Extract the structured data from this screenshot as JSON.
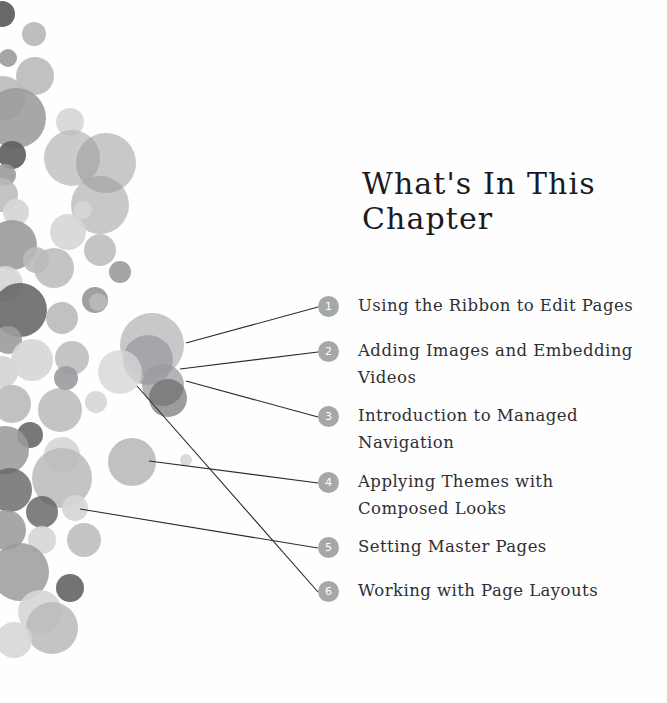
{
  "page": {
    "background_color": "#fefefe",
    "title": "What's In This Chapter",
    "title_color": "#1b1b1f",
    "text_color": "#2f2f33",
    "bullet_color": "#a6a7a9",
    "bullet_text_color": "#ffffff",
    "line_color": "#2b2b2b"
  },
  "toc": {
    "items": [
      {
        "number": "1",
        "label": "Using the Ribbon to Edit Pages"
      },
      {
        "number": "2",
        "label": "Adding Images and Embedding Videos"
      },
      {
        "number": "3",
        "label": "Introduction to Managed Navigation"
      },
      {
        "number": "4",
        "label": "Applying Themes with Composed Looks"
      },
      {
        "number": "5",
        "label": "Setting Master Pages"
      },
      {
        "number": "6",
        "label": "Working with Page Layouts"
      }
    ]
  },
  "decor": {
    "palette": {
      "dark": "#5f6062",
      "mid": "#9a9b9d",
      "light": "#b9babb",
      "pale": "#d5d6d7"
    },
    "circles": [
      {
        "cx": 2,
        "cy": 14,
        "r": 13,
        "c": "#5f6062",
        "o": 0.95
      },
      {
        "cx": 34,
        "cy": 34,
        "r": 12,
        "c": "#b9babb",
        "o": 0.95
      },
      {
        "cx": 8,
        "cy": 58,
        "r": 9,
        "c": "#9a9b9d",
        "o": 0.9
      },
      {
        "cx": 35,
        "cy": 76,
        "r": 19,
        "c": "#b9babb",
        "o": 0.9
      },
      {
        "cx": 3,
        "cy": 98,
        "r": 22,
        "c": "#b9babb",
        "o": 0.9
      },
      {
        "cx": 16,
        "cy": 118,
        "r": 30,
        "c": "#9a9b9d",
        "o": 0.88
      },
      {
        "cx": 12,
        "cy": 155,
        "r": 14,
        "c": "#5f6062",
        "o": 0.92
      },
      {
        "cx": 5,
        "cy": 175,
        "r": 11,
        "c": "#9a9b9d",
        "o": 0.9
      },
      {
        "cx": 1,
        "cy": 195,
        "r": 17,
        "c": "#b9babb",
        "o": 0.85
      },
      {
        "cx": 16,
        "cy": 212,
        "r": 13,
        "c": "#d5d6d7",
        "o": 0.95
      },
      {
        "cx": 70,
        "cy": 122,
        "r": 14,
        "c": "#d5d6d7",
        "o": 0.9
      },
      {
        "cx": 72,
        "cy": 158,
        "r": 28,
        "c": "#b9babb",
        "o": 0.75
      },
      {
        "cx": 12,
        "cy": 245,
        "r": 25,
        "c": "#9a9b9d",
        "o": 0.9
      },
      {
        "cx": 5,
        "cy": 284,
        "r": 18,
        "c": "#d5d6d7",
        "o": 0.9
      },
      {
        "cx": 36,
        "cy": 260,
        "r": 13,
        "c": "#b9babb",
        "o": 0.9
      },
      {
        "cx": 100,
        "cy": 205,
        "r": 29,
        "c": "#b9babb",
        "o": 0.8
      },
      {
        "cx": 106,
        "cy": 163,
        "r": 30,
        "c": "#9a9b9d",
        "o": 0.55
      },
      {
        "cx": 20,
        "cy": 310,
        "r": 27,
        "c": "#5f6062",
        "o": 0.85
      },
      {
        "cx": 62,
        "cy": 318,
        "r": 16,
        "c": "#b9babb",
        "o": 0.9
      },
      {
        "cx": 8,
        "cy": 340,
        "r": 14,
        "c": "#9a9b9d",
        "o": 0.9
      },
      {
        "cx": 54,
        "cy": 268,
        "r": 20,
        "c": "#b9babb",
        "o": 0.85
      },
      {
        "cx": 95,
        "cy": 300,
        "r": 13,
        "c": "#9a9b9d",
        "o": 0.95
      },
      {
        "cx": 2,
        "cy": 372,
        "r": 16,
        "c": "#d5d6d7",
        "o": 0.95
      },
      {
        "cx": 32,
        "cy": 360,
        "r": 21,
        "c": "#d5d6d7",
        "o": 0.9
      },
      {
        "cx": 72,
        "cy": 358,
        "r": 17,
        "c": "#b9babb",
        "o": 0.85
      },
      {
        "cx": 12,
        "cy": 404,
        "r": 19,
        "c": "#b9babb",
        "o": 0.9
      },
      {
        "cx": 60,
        "cy": 410,
        "r": 22,
        "c": "#b9babb",
        "o": 0.85
      },
      {
        "cx": 30,
        "cy": 435,
        "r": 13,
        "c": "#5f6062",
        "o": 0.85
      },
      {
        "cx": 5,
        "cy": 450,
        "r": 24,
        "c": "#9a9b9d",
        "o": 0.88
      },
      {
        "cx": 62,
        "cy": 455,
        "r": 18,
        "c": "#d5d6d7",
        "o": 0.9
      },
      {
        "cx": 66,
        "cy": 378,
        "r": 12,
        "c": "#9a9b9d",
        "o": 0.9
      },
      {
        "cx": 96,
        "cy": 402,
        "r": 11,
        "c": "#d5d6d7",
        "o": 0.9
      },
      {
        "cx": 120,
        "cy": 272,
        "r": 11,
        "c": "#9a9b9d",
        "o": 0.9
      },
      {
        "cx": 100,
        "cy": 250,
        "r": 16,
        "c": "#b9babb",
        "o": 0.85
      },
      {
        "cx": 68,
        "cy": 232,
        "r": 18,
        "c": "#d5d6d7",
        "o": 0.9
      },
      {
        "cx": 152,
        "cy": 345,
        "r": 32,
        "c": "#b9babb",
        "o": 0.8
      },
      {
        "cx": 148,
        "cy": 360,
        "r": 25,
        "c": "#9a9b9d",
        "o": 0.75
      },
      {
        "cx": 120,
        "cy": 372,
        "r": 22,
        "c": "#d5d6d7",
        "o": 0.8
      },
      {
        "cx": 163,
        "cy": 385,
        "r": 21,
        "c": "#9a9b9d",
        "o": 0.75
      },
      {
        "cx": 168,
        "cy": 398,
        "r": 19,
        "c": "#5f6062",
        "o": 0.62
      },
      {
        "cx": 132,
        "cy": 462,
        "r": 24,
        "c": "#b9babb",
        "o": 0.9
      },
      {
        "cx": 62,
        "cy": 478,
        "r": 30,
        "c": "#b9babb",
        "o": 0.85
      },
      {
        "cx": 10,
        "cy": 490,
        "r": 22,
        "c": "#5f6062",
        "o": 0.78
      },
      {
        "cx": 42,
        "cy": 512,
        "r": 16,
        "c": "#5f6062",
        "o": 0.8
      },
      {
        "cx": 75,
        "cy": 508,
        "r": 13,
        "c": "#d5d6d7",
        "o": 0.92
      },
      {
        "cx": 6,
        "cy": 530,
        "r": 20,
        "c": "#9a9b9d",
        "o": 0.88
      },
      {
        "cx": 42,
        "cy": 540,
        "r": 14,
        "c": "#d5d6d7",
        "o": 0.9
      },
      {
        "cx": 84,
        "cy": 540,
        "r": 17,
        "c": "#b9babb",
        "o": 0.85
      },
      {
        "cx": 20,
        "cy": 572,
        "r": 29,
        "c": "#9a9b9d",
        "o": 0.85
      },
      {
        "cx": 70,
        "cy": 588,
        "r": 14,
        "c": "#5f6062",
        "o": 0.88
      },
      {
        "cx": 40,
        "cy": 612,
        "r": 22,
        "c": "#d5d6d7",
        "o": 0.9
      },
      {
        "cx": 52,
        "cy": 628,
        "r": 26,
        "c": "#b9babb",
        "o": 0.85
      },
      {
        "cx": 14,
        "cy": 640,
        "r": 18,
        "c": "#d5d6d7",
        "o": 0.88
      },
      {
        "cx": 98,
        "cy": 302,
        "r": 9,
        "c": "#b9babb",
        "o": 0.9
      },
      {
        "cx": 186,
        "cy": 460,
        "r": 6,
        "c": "#d5d6d7",
        "o": 0.9
      },
      {
        "cx": 83,
        "cy": 210,
        "r": 9,
        "c": "#d5d6d7",
        "o": 0.9
      }
    ],
    "connector_lines": [
      {
        "x1": 186,
        "y1": 343,
        "x2": 318,
        "y2": 307
      },
      {
        "x1": 180,
        "y1": 369,
        "x2": 318,
        "y2": 352
      },
      {
        "x1": 186,
        "y1": 381,
        "x2": 318,
        "y2": 417
      },
      {
        "x1": 149,
        "y1": 461,
        "x2": 318,
        "y2": 483
      },
      {
        "x1": 80,
        "y1": 509,
        "x2": 318,
        "y2": 548
      },
      {
        "x1": 137,
        "y1": 386,
        "x2": 318,
        "y2": 592
      }
    ]
  }
}
